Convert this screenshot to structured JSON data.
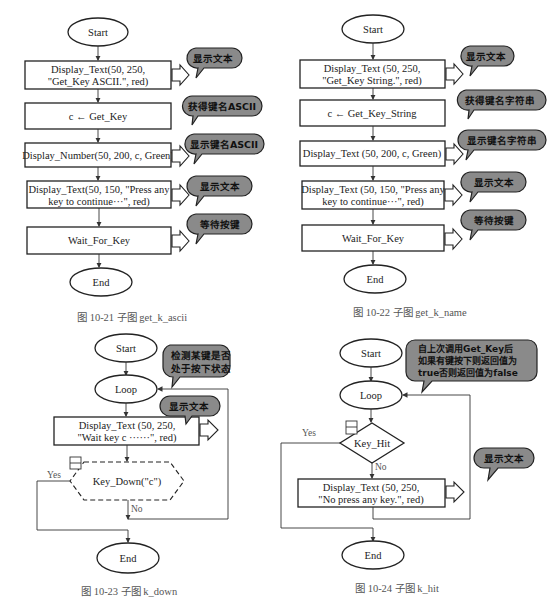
{
  "fig21": {
    "start": "Start",
    "step1_l1": "Display_Text(50, 250,",
    "step1_l2": "\"Get_Key ASCII.\", red)",
    "step2": "c ← Get_Key",
    "step3": "Display_Number(50, 200, c, Green)",
    "step4_l1": "Display_Text(50, 150, \"Press any",
    "step4_l2": "key to continue···\", red)",
    "step5": "Wait_For_Key",
    "end": "End",
    "note1": "显示文本",
    "note2": "获得键名ASCII",
    "note3": "显示键名ASCII",
    "note4": "显示文本",
    "note5": "等待按键",
    "caption": "图 10-21   子图 get_k_ascii"
  },
  "fig22": {
    "start": "Start",
    "step1_l1": "Display_Text (50, 250,",
    "step1_l2": "\"Get_Key String.\", red)",
    "step2": "c ← Get_Key_String",
    "step3": "Display_Text (50, 200, c, Green)",
    "step4_l1": "Display_Text (50, 150, \"Press any",
    "step4_l2": "key to continue···\", red)",
    "step5": "Wait_For_Key",
    "end": "End",
    "note1": "显示文本",
    "note2": "获得键名字符串",
    "note3": "显示键名字符串",
    "note4": "显示文本",
    "note5": "等待按键",
    "caption": "图 10-22   子图 get_k_name"
  },
  "fig23": {
    "start": "Start",
    "loop": "Loop",
    "step1_l1": "Display_Text (50, 250,",
    "step1_l2": "\"Wait key c ······\", red)",
    "decision": "Key_Down(\"c\")",
    "yes": "Yes",
    "no": "No",
    "end": "End",
    "note1_l1": "检测某键是否",
    "note1_l2": "处于按下状态",
    "note2": "显示文本",
    "caption": "图 10-23   子图 k_down"
  },
  "fig24": {
    "start": "Start",
    "loop": "Loop",
    "decision": "Key_Hit",
    "yes": "Yes",
    "no": "No",
    "step1_l1": "Display_Text (50, 250,",
    "step1_l2": "\"No press any key.\", red)",
    "end": "End",
    "note1_l1": "自上次调用Get_Key后",
    "note1_l2": "如果有键按下则返回值为",
    "note1_l3": "true否则返回值为false",
    "note2": "显示文本",
    "caption": "图 10-24   子图 k_hit"
  }
}
